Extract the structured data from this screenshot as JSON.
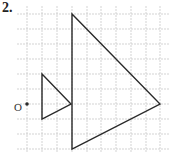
{
  "problem_number": "2.",
  "origin_label": "O",
  "colors": {
    "grid": "#c8c8c8",
    "shape": "#2a2a2a",
    "background": "#ffffff"
  },
  "grid": {
    "x_lines": [
      27,
      42,
      57,
      72,
      87,
      101,
      116,
      131,
      146,
      160
    ],
    "y_lines": [
      14,
      29,
      44,
      59,
      74,
      89,
      104,
      119,
      134,
      149
    ]
  },
  "origin_point": {
    "x": 27,
    "y": 104
  },
  "small_triangle": {
    "vertices": [
      [
        42,
        74
      ],
      [
        42,
        119
      ],
      [
        71,
        104
      ]
    ],
    "grid_coords": [
      [
        1,
        -2
      ],
      [
        1,
        1
      ],
      [
        3,
        0
      ]
    ]
  },
  "large_triangle": {
    "vertices": [
      [
        72,
        14
      ],
      [
        72,
        149
      ],
      [
        160,
        104
      ]
    ],
    "grid_coords": [
      [
        3,
        -6
      ],
      [
        3,
        3
      ],
      [
        9,
        0
      ]
    ]
  }
}
